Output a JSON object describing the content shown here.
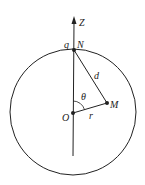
{
  "diagram": {
    "labels": {
      "axis": "Z",
      "charge": "q",
      "top_point": "N",
      "distance": "d",
      "angle": "θ",
      "field_point": "M",
      "center": "O",
      "radius": "r"
    },
    "colors": {
      "stroke": "#222222",
      "background": "#ffffff"
    }
  }
}
